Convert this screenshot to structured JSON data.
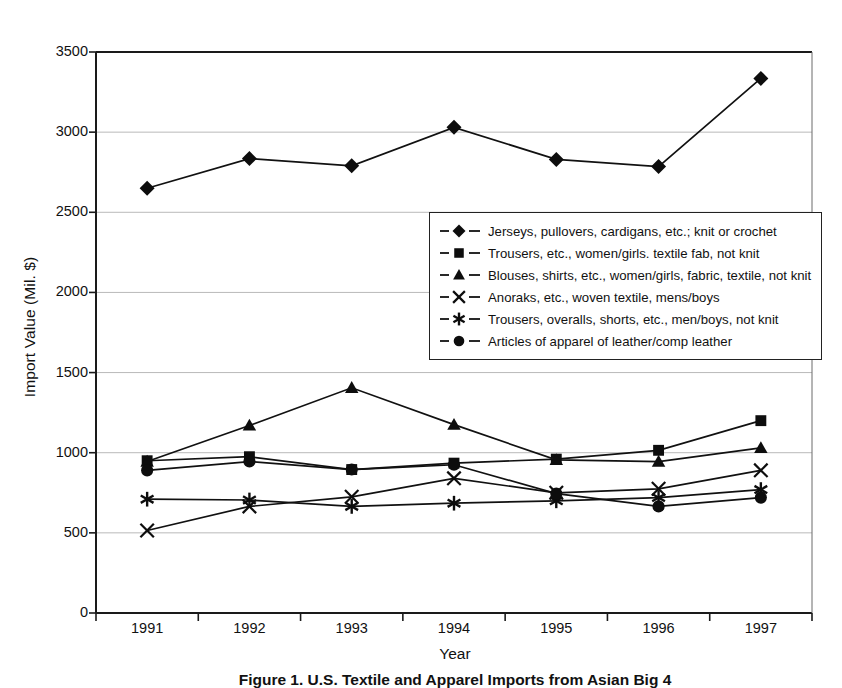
{
  "chart_data": {
    "type": "line",
    "title": "",
    "xlabel": "Year",
    "ylabel": "Import Value (Mil. $)",
    "categories": [
      "1991",
      "1992",
      "1993",
      "1994",
      "1995",
      "1996",
      "1997"
    ],
    "ylim": [
      0,
      3500
    ],
    "ytick_step": 500,
    "yticks": [
      "0",
      "500",
      "1000",
      "1500",
      "2000",
      "2500",
      "3000",
      "3500"
    ],
    "grid": "horizontal",
    "legend_position": "center",
    "series": [
      {
        "name": "Jerseys, pullovers, cardigans, etc.; knit or crochet",
        "marker": "diamond",
        "values": [
          2650,
          2835,
          2790,
          3030,
          2830,
          2785,
          3335
        ]
      },
      {
        "name": "Trousers, etc., women/girls. textile fab, not knit",
        "marker": "square",
        "values": [
          950,
          975,
          895,
          935,
          960,
          1015,
          1200
        ]
      },
      {
        "name": "Blouses, shirts, etc., women/girls, fabric, textile, not knit",
        "marker": "triangle",
        "values": [
          945,
          1170,
          1405,
          1175,
          955,
          945,
          1030
        ]
      },
      {
        "name": "Anoraks, etc., woven textile, mens/boys",
        "marker": "cross",
        "values": [
          515,
          665,
          725,
          840,
          750,
          775,
          890
        ]
      },
      {
        "name": "Trousers, overalls, shorts, etc., men/boys, not knit",
        "marker": "star",
        "values": [
          710,
          705,
          665,
          685,
          700,
          720,
          770
        ]
      },
      {
        "name": "Articles of apparel of leather/comp leather",
        "marker": "circle",
        "values": [
          890,
          945,
          895,
          925,
          745,
          665,
          720
        ]
      }
    ]
  },
  "caption": "Figure 1. U.S. Textile and Apparel Imports from Asian Big 4"
}
